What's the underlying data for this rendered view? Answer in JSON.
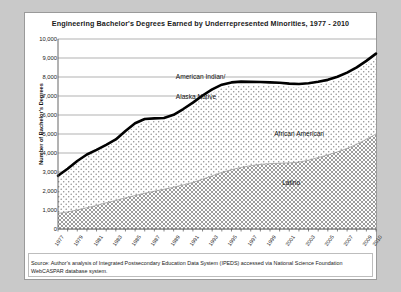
{
  "figure": {
    "title": "Engineering Bachelor's Degrees Earned by Underrepresented Minorities,  1977 - 2010",
    "source": "Source:  Author's analysis of Integrated Postsecondary Education Data System (IPEDS) accessed via National Science Foundation WebCASPAR database system."
  },
  "labels": {
    "american_indian": "American Indian/",
    "alaska_native": "Alaska Native",
    "african_american": "African American",
    "latino": "Latino"
  },
  "chart_data": {
    "type": "area",
    "title": "Engineering Bachelor's Degrees Earned by Underrepresented Minorities,  1977 - 2010",
    "xlabel": "",
    "ylabel": "Number of Bachelor's Degrees",
    "ylim": [
      0,
      10000
    ],
    "ytick_labels": [
      "10,000",
      "9,000",
      "8,000",
      "7,000",
      "6,000",
      "5,000",
      "4,000",
      "3,000",
      "2,000",
      "1,000",
      "0"
    ],
    "ytick_values": [
      10000,
      9000,
      8000,
      7000,
      6000,
      5000,
      4000,
      3000,
      2000,
      1000,
      0
    ],
    "grid": true,
    "legend_position": "inline-annotations",
    "stacked": true,
    "x": [
      1977,
      1978,
      1979,
      1980,
      1981,
      1982,
      1983,
      1984,
      1985,
      1986,
      1987,
      1988,
      1989,
      1990,
      1991,
      1992,
      1993,
      1994,
      1995,
      1996,
      1997,
      1998,
      1999,
      2000,
      2001,
      2002,
      2003,
      2004,
      2005,
      2006,
      2007,
      2008,
      2009,
      2010
    ],
    "xtick_labels": [
      "1977",
      "1979",
      "1981",
      "1983",
      "1985",
      "1987",
      "1989",
      "1991",
      "1993",
      "1995",
      "1997",
      "1999",
      "2001",
      "2003",
      "2005",
      "2007",
      "2009",
      "2010"
    ],
    "xtick_values": [
      1977,
      1979,
      1981,
      1983,
      1985,
      1987,
      1989,
      1991,
      1993,
      1995,
      1997,
      1999,
      2001,
      2003,
      2005,
      2007,
      2009,
      2010
    ],
    "series": [
      {
        "name": "Latino",
        "values": [
          820,
          900,
          1000,
          1120,
          1240,
          1380,
          1500,
          1640,
          1760,
          1880,
          1990,
          2090,
          2200,
          2320,
          2450,
          2620,
          2800,
          2980,
          3120,
          3240,
          3330,
          3400,
          3440,
          3460,
          3480,
          3520,
          3620,
          3760,
          3900,
          4060,
          4240,
          4460,
          4720,
          5000
        ]
      },
      {
        "name": "African American",
        "values": [
          1900,
          2180,
          2480,
          2700,
          2820,
          2940,
          3100,
          3400,
          3680,
          3780,
          3700,
          3620,
          3680,
          3860,
          4060,
          4260,
          4400,
          4460,
          4440,
          4360,
          4260,
          4180,
          4120,
          4080,
          4020,
          3960,
          3900,
          3840,
          3800,
          3800,
          3840,
          3900,
          3980,
          4080
        ]
      },
      {
        "name": "American Indian/Alaska Native",
        "values": [
          80,
          90,
          100,
          100,
          105,
          110,
          115,
          120,
          125,
          130,
          130,
          130,
          130,
          135,
          140,
          145,
          150,
          155,
          155,
          155,
          155,
          155,
          155,
          155,
          150,
          150,
          150,
          150,
          150,
          150,
          150,
          150,
          150,
          150
        ]
      }
    ],
    "totals": [
      2800,
      3170,
      3580,
      3920,
      4165,
      4430,
      4715,
      5160,
      5565,
      5790,
      5820,
      5840,
      6010,
      6315,
      6650,
      7025,
      7350,
      7595,
      7715,
      7755,
      7745,
      7735,
      7715,
      7695,
      7650,
      7630,
      7670,
      7750,
      7850,
      8010,
      8230,
      8510,
      8850,
      9230
    ]
  }
}
